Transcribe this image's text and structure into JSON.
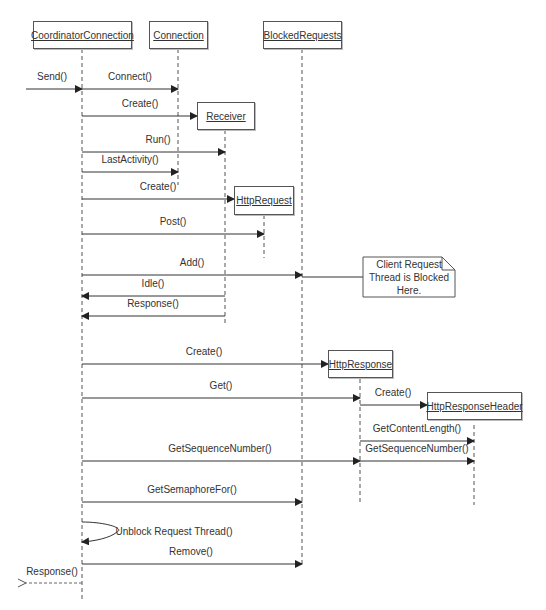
{
  "diagram": {
    "type": "uml-sequence",
    "objects": [
      {
        "id": "cc",
        "name": "CoordinatorConnection"
      },
      {
        "id": "conn",
        "name": "Connection"
      },
      {
        "id": "br",
        "name": "BlockedRequests"
      },
      {
        "id": "recv",
        "name": "Receiver"
      },
      {
        "id": "hreq",
        "name": "HttpRequest"
      },
      {
        "id": "hresp",
        "name": "HttpResponse"
      },
      {
        "id": "hrh",
        "name": "HttpResponseHeader"
      }
    ],
    "messages": [
      {
        "label": "Send()",
        "from": "external",
        "to": "CoordinatorConnection"
      },
      {
        "label": "Connect()",
        "from": "CoordinatorConnection",
        "to": "Connection"
      },
      {
        "label": "Create()",
        "from": "CoordinatorConnection",
        "to": "Receiver"
      },
      {
        "label": "Run()",
        "from": "CoordinatorConnection",
        "to": "Receiver"
      },
      {
        "label": "LastActivity()",
        "from": "CoordinatorConnection",
        "to": "Connection"
      },
      {
        "label": "Create()",
        "from": "CoordinatorConnection",
        "to": "HttpRequest"
      },
      {
        "label": "Post()",
        "from": "CoordinatorConnection",
        "to": "HttpRequest"
      },
      {
        "label": "Add()",
        "from": "CoordinatorConnection",
        "to": "BlockedRequests"
      },
      {
        "label": "Idle()",
        "from": "Receiver",
        "to": "CoordinatorConnection"
      },
      {
        "label": "Response()",
        "from": "Receiver",
        "to": "CoordinatorConnection"
      },
      {
        "label": "Create()",
        "from": "CoordinatorConnection",
        "to": "HttpResponse"
      },
      {
        "label": "Get()",
        "from": "CoordinatorConnection",
        "to": "HttpResponse"
      },
      {
        "label": "Create()",
        "from": "HttpResponse",
        "to": "HttpResponseHeader"
      },
      {
        "label": "GetContentLength()",
        "from": "HttpResponse",
        "to": "HttpResponseHeader"
      },
      {
        "label": "GetSequenceNumber()",
        "from": "CoordinatorConnection",
        "to": "HttpResponse"
      },
      {
        "label": "GetSequenceNumber()",
        "from": "HttpResponse",
        "to": "HttpResponseHeader"
      },
      {
        "label": "GetSemaphoreFor()",
        "from": "CoordinatorConnection",
        "to": "BlockedRequests"
      },
      {
        "label": "Unblock Request Thread()",
        "from": "CoordinatorConnection",
        "to": "CoordinatorConnection"
      },
      {
        "label": "Remove()",
        "from": "CoordinatorConnection",
        "to": "BlockedRequests"
      },
      {
        "label": "Response()",
        "from": "CoordinatorConnection",
        "to": "external",
        "style": "dashed-return"
      }
    ],
    "note": {
      "line1": "Client Request",
      "line2": "Thread is Blocked Here."
    }
  }
}
